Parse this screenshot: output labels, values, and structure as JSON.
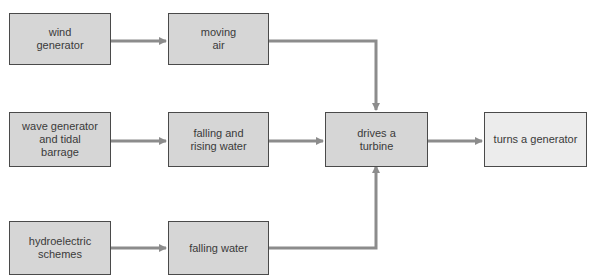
{
  "diagram": {
    "nodes": {
      "wind_generator": "wind\ngenerator",
      "moving_air": "moving\nair",
      "wave_generator": "wave generator\nand tidal\nbarrage",
      "falling_rising_water": "falling and\nrising water",
      "hydroelectric": "hydroelectric\nschemes",
      "falling_water": "falling water",
      "drives_turbine": "drives a\nturbine",
      "turns_generator": "turns a generator"
    },
    "edges": [
      [
        "wind_generator",
        "moving_air"
      ],
      [
        "wave_generator",
        "falling_rising_water"
      ],
      [
        "hydroelectric",
        "falling_water"
      ],
      [
        "moving_air",
        "drives_turbine"
      ],
      [
        "falling_rising_water",
        "drives_turbine"
      ],
      [
        "falling_water",
        "drives_turbine"
      ],
      [
        "drives_turbine",
        "turns_generator"
      ]
    ],
    "colors": {
      "box_fill": "#d6d6d6",
      "output_fill": "#ececec",
      "arrow": "#8c8c8c",
      "border": "#4a4a4a"
    }
  }
}
